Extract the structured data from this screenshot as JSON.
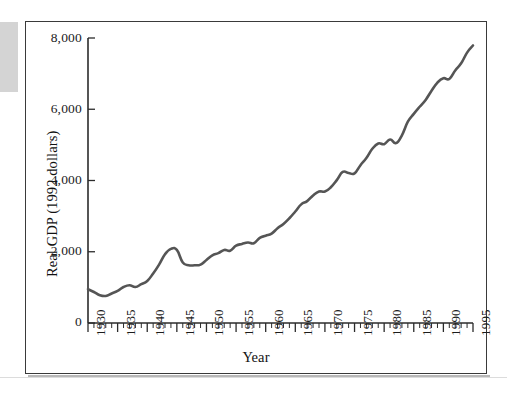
{
  "figure": {
    "background_color": "#ffffff",
    "frame_color": "#3a3a3a",
    "artifact_color": "#d4d4d4"
  },
  "chart_data": {
    "type": "line",
    "title": "",
    "xlabel": "Year",
    "ylabel": "Real GDP (1992 dollars)",
    "xlim": [
      1930,
      1995
    ],
    "ylim": [
      0,
      8000
    ],
    "grid": false,
    "legend": null,
    "line_color": "#555555",
    "y_ticks": [
      0,
      2000,
      4000,
      6000,
      8000
    ],
    "y_tick_labels": [
      "0",
      "2,000",
      "4,000",
      "6,000",
      "8,000"
    ],
    "x_ticks": [
      1930,
      1935,
      1940,
      1945,
      1950,
      1955,
      1960,
      1965,
      1970,
      1975,
      1980,
      1985,
      1990,
      1995
    ],
    "x_tick_labels": [
      "1930",
      "1935",
      "1940",
      "1945",
      "1950",
      "1955",
      "1960",
      "1965",
      "1970",
      "1975",
      "1980",
      "1985",
      "1990",
      "1995"
    ],
    "x_minor_tick_interval": 1,
    "series": [
      {
        "name": "Real GDP (1992 dollars)",
        "x": [
          1930,
          1931,
          1932,
          1933,
          1934,
          1935,
          1936,
          1937,
          1938,
          1939,
          1940,
          1941,
          1942,
          1943,
          1944,
          1945,
          1946,
          1947,
          1948,
          1949,
          1950,
          1951,
          1952,
          1953,
          1954,
          1955,
          1956,
          1957,
          1958,
          1959,
          1960,
          1961,
          1962,
          1963,
          1964,
          1965,
          1966,
          1967,
          1968,
          1969,
          1970,
          1971,
          1972,
          1973,
          1974,
          1975,
          1976,
          1977,
          1978,
          1979,
          1980,
          1981,
          1982,
          1983,
          1984,
          1985,
          1986,
          1987,
          1988,
          1989,
          1990,
          1991,
          1992,
          1993,
          1994,
          1995
        ],
        "values": [
          950,
          870,
          780,
          760,
          830,
          900,
          1010,
          1060,
          1010,
          1090,
          1180,
          1390,
          1640,
          1930,
          2080,
          2050,
          1700,
          1620,
          1620,
          1640,
          1770,
          1900,
          1960,
          2050,
          2030,
          2170,
          2220,
          2260,
          2240,
          2390,
          2450,
          2510,
          2660,
          2780,
          2940,
          3130,
          3330,
          3420,
          3580,
          3690,
          3690,
          3810,
          4010,
          4240,
          4210,
          4200,
          4430,
          4630,
          4890,
          5040,
          5020,
          5150,
          5050,
          5270,
          5650,
          5870,
          6070,
          6260,
          6520,
          6750,
          6870,
          6850,
          7090,
          7290,
          7590,
          7790
        ],
        "value_unit": "billions of 1992 dollars",
        "start_value": 950,
        "end_value": 6800,
        "peak_wwii_year": 1944,
        "trough_depression_year": 1933
      }
    ]
  }
}
